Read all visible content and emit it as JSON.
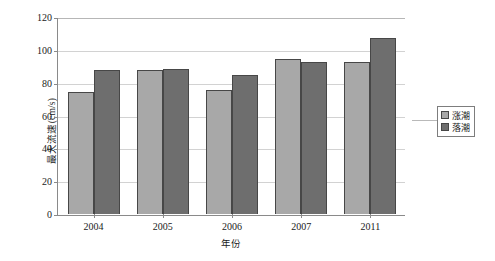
{
  "chart_data": {
    "type": "bar",
    "title": "",
    "xlabel": "年份",
    "ylabel": "最大流速(cm/s)",
    "categories": [
      "2004",
      "2005",
      "2006",
      "2007",
      "2011"
    ],
    "series": [
      {
        "name": "涨潮",
        "color": "#a8a8a8",
        "values": [
          75,
          88,
          76,
          95,
          93
        ]
      },
      {
        "name": "落潮",
        "color": "#6e6e6e",
        "values": [
          88,
          89,
          85,
          93,
          108
        ]
      }
    ],
    "ylim": [
      0,
      120
    ],
    "yticks": [
      0,
      20,
      40,
      60,
      80,
      100,
      120
    ],
    "ytick_labels": [
      "0",
      "20",
      "40",
      "60",
      "80",
      "100",
      "120"
    ],
    "grid": true,
    "grid_axis": "y",
    "legend_position": "right"
  },
  "legend": {
    "entries": [
      {
        "label": "涨潮",
        "swatch": "legend-swatch-rising"
      },
      {
        "label": "落潮",
        "swatch": "legend-swatch-falling"
      }
    ]
  }
}
